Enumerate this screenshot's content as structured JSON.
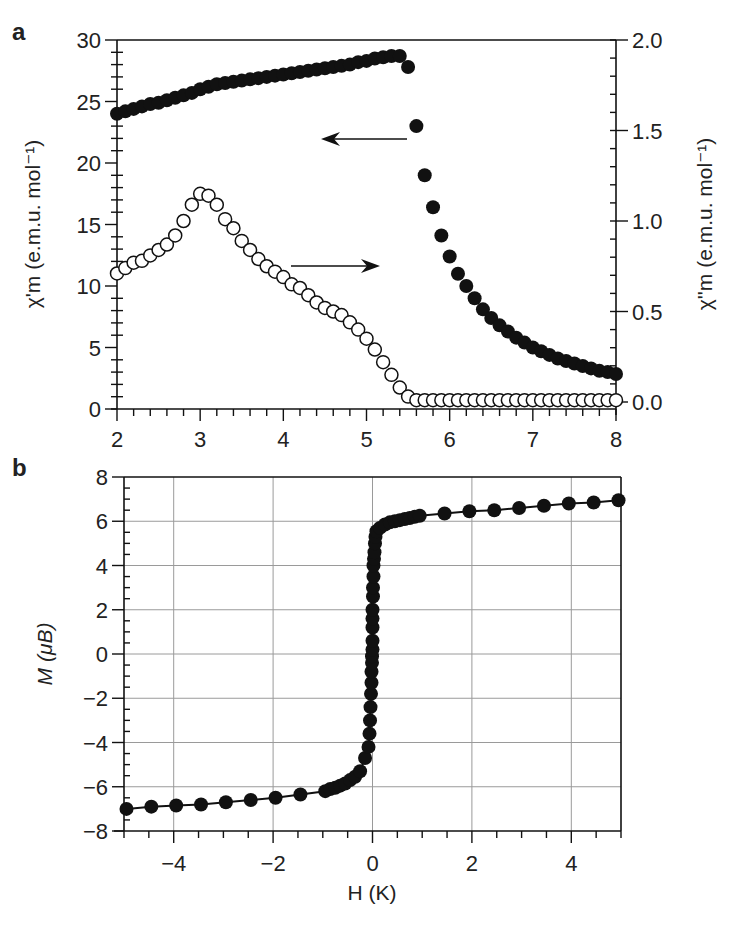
{
  "figure": {
    "panels": [
      {
        "letter": "a"
      },
      {
        "letter": "b"
      }
    ]
  },
  "chart_data": [
    {
      "panel": "a",
      "type": "scatter",
      "title": "",
      "xlabel": "",
      "xlim": [
        2,
        8
      ],
      "xticks": [
        2,
        3,
        4,
        5,
        6,
        7,
        8
      ],
      "xminor_step": 0.2,
      "ylabel_left": "χ'm (e.m.u. mol⁻¹)",
      "ylim_left": [
        0,
        30
      ],
      "yticks_left": [
        0,
        5,
        10,
        15,
        20,
        25,
        30
      ],
      "yminor_step_left": 1,
      "ylabel_right": "χ''m (e.m.u. mol⁻¹)",
      "ylim_right": [
        0,
        2.0
      ],
      "yticks_right": [
        "0.0",
        "0.5",
        "1.0",
        "1.5",
        "2.0"
      ],
      "yminor_step_right": 0.1,
      "grid": false,
      "annotations": [
        {
          "type": "arrow",
          "direction": "left",
          "meaning": "filled circles read on left axis (χ'm)"
        },
        {
          "type": "arrow",
          "direction": "right",
          "meaning": "open circles read on right axis (χ''m)"
        }
      ],
      "series": [
        {
          "name": "χ'm (in-phase)",
          "marker": "filled-circle",
          "axis": "left",
          "x": [
            2.0,
            2.1,
            2.2,
            2.3,
            2.4,
            2.5,
            2.6,
            2.7,
            2.8,
            2.9,
            3.0,
            3.1,
            3.2,
            3.3,
            3.4,
            3.5,
            3.6,
            3.7,
            3.8,
            3.9,
            4.0,
            4.1,
            4.2,
            4.3,
            4.4,
            4.5,
            4.6,
            4.7,
            4.8,
            4.9,
            5.0,
            5.1,
            5.2,
            5.3,
            5.4,
            5.5,
            5.6,
            5.7,
            5.8,
            5.9,
            6.0,
            6.1,
            6.2,
            6.3,
            6.4,
            6.5,
            6.6,
            6.7,
            6.8,
            6.9,
            7.0,
            7.1,
            7.2,
            7.3,
            7.4,
            7.5,
            7.6,
            7.7,
            7.8,
            7.9,
            8.0
          ],
          "y": [
            24.0,
            24.2,
            24.4,
            24.6,
            24.8,
            24.9,
            25.1,
            25.3,
            25.5,
            25.7,
            26.0,
            26.2,
            26.4,
            26.5,
            26.6,
            26.7,
            26.8,
            26.9,
            27.0,
            27.1,
            27.2,
            27.3,
            27.4,
            27.5,
            27.6,
            27.7,
            27.8,
            27.9,
            28.0,
            28.2,
            28.3,
            28.5,
            28.6,
            28.7,
            28.7,
            27.8,
            23.0,
            19.0,
            16.4,
            14.1,
            12.4,
            11.0,
            10.0,
            9.0,
            8.1,
            7.4,
            6.8,
            6.3,
            5.8,
            5.4,
            5.0,
            4.7,
            4.4,
            4.1,
            3.9,
            3.7,
            3.5,
            3.3,
            3.1,
            3.0,
            2.85
          ]
        },
        {
          "name": "χ''m (out-of-phase)",
          "marker": "open-circle",
          "axis": "right",
          "x": [
            2.0,
            2.1,
            2.2,
            2.3,
            2.4,
            2.5,
            2.6,
            2.7,
            2.8,
            2.9,
            3.0,
            3.1,
            3.2,
            3.3,
            3.4,
            3.5,
            3.6,
            3.7,
            3.8,
            3.9,
            4.0,
            4.1,
            4.2,
            4.3,
            4.4,
            4.5,
            4.6,
            4.7,
            4.8,
            4.9,
            5.0,
            5.1,
            5.2,
            5.3,
            5.4,
            5.5,
            5.6,
            5.7,
            5.8,
            5.9,
            6.0,
            6.1,
            6.2,
            6.3,
            6.4,
            6.5,
            6.6,
            6.7,
            6.8,
            6.9,
            7.0,
            7.1,
            7.2,
            7.3,
            7.4,
            7.5,
            7.6,
            7.7,
            7.8,
            7.9,
            8.0
          ],
          "y": [
            0.71,
            0.74,
            0.77,
            0.78,
            0.81,
            0.84,
            0.87,
            0.92,
            1.0,
            1.09,
            1.15,
            1.14,
            1.09,
            1.01,
            0.96,
            0.89,
            0.84,
            0.79,
            0.75,
            0.72,
            0.69,
            0.65,
            0.63,
            0.59,
            0.55,
            0.52,
            0.5,
            0.48,
            0.44,
            0.4,
            0.35,
            0.29,
            0.22,
            0.15,
            0.08,
            0.03,
            0.01,
            0.01,
            0.01,
            0.01,
            0.01,
            0.01,
            0.01,
            0.01,
            0.01,
            0.01,
            0.01,
            0.01,
            0.01,
            0.01,
            0.01,
            0.01,
            0.01,
            0.01,
            0.01,
            0.01,
            0.01,
            0.01,
            0.01,
            0.01,
            0.01
          ]
        }
      ]
    },
    {
      "panel": "b",
      "type": "line",
      "title": "",
      "xlabel": "H (K)",
      "ylabel": "M (μB)",
      "xlim": [
        -5,
        5
      ],
      "xticks": [
        -4,
        -2,
        0,
        2,
        4
      ],
      "xtick_labels": [
        "−4",
        "−2",
        "0",
        "2",
        "4"
      ],
      "xminor_step": 0.5,
      "ylim": [
        -8,
        8
      ],
      "yticks": [
        -8,
        -6,
        -4,
        -2,
        0,
        2,
        4,
        6,
        8
      ],
      "ytick_labels": [
        "−8",
        "−6",
        "−4",
        "−2",
        "0",
        "2",
        "4",
        "6",
        "8"
      ],
      "yminor_step": 0.5,
      "grid": true,
      "series": [
        {
          "name": "M vs H",
          "marker": "filled-circle",
          "line": true,
          "x": [
            -4.95,
            -4.45,
            -3.95,
            -3.45,
            -2.95,
            -2.45,
            -1.95,
            -1.45,
            -0.95,
            -0.85,
            -0.75,
            -0.65,
            -0.55,
            -0.45,
            -0.35,
            -0.25,
            -0.15,
            -0.08,
            -0.06,
            -0.05,
            -0.04,
            -0.03,
            -0.02,
            -0.02,
            -0.01,
            -0.01,
            0.0,
            0.0,
            0.0,
            0.0,
            0.0,
            0.01,
            0.01,
            0.02,
            0.02,
            0.03,
            0.04,
            0.05,
            0.06,
            0.08,
            0.15,
            0.25,
            0.35,
            0.45,
            0.55,
            0.65,
            0.75,
            0.85,
            0.95,
            1.45,
            1.95,
            2.45,
            2.95,
            3.45,
            3.95,
            4.45,
            4.95
          ],
          "y": [
            -7.0,
            -6.9,
            -6.85,
            -6.8,
            -6.7,
            -6.6,
            -6.5,
            -6.35,
            -6.2,
            -6.1,
            -6.05,
            -5.95,
            -5.85,
            -5.7,
            -5.55,
            -5.3,
            -4.7,
            -4.2,
            -3.6,
            -3.0,
            -2.4,
            -1.8,
            -1.3,
            -0.8,
            -0.4,
            -0.1,
            0.2,
            0.6,
            1.2,
            1.6,
            2.0,
            2.6,
            3.0,
            3.5,
            4.0,
            4.3,
            4.6,
            5.0,
            5.3,
            5.55,
            5.7,
            5.85,
            5.95,
            6.0,
            6.05,
            6.1,
            6.15,
            6.2,
            6.25,
            6.35,
            6.45,
            6.5,
            6.6,
            6.7,
            6.8,
            6.85,
            6.95
          ]
        }
      ]
    }
  ]
}
